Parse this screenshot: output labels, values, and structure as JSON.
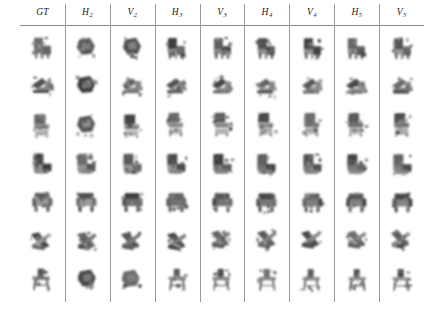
{
  "figure": {
    "kind": "qualitative-comparison-grid",
    "columns": 9,
    "rows": 7,
    "background_color": "#ffffff",
    "rule_color": "#8a8a8a",
    "separator_color": "#9a9a9a",
    "object_category": "chair",
    "render_style": "blurry grayscale voxel reconstruction"
  },
  "header": {
    "labels": [
      {
        "base": "GT",
        "sub": ""
      },
      {
        "base": "H",
        "sub": "2"
      },
      {
        "base": "V",
        "sub": "2"
      },
      {
        "base": "H",
        "sub": "3"
      },
      {
        "base": "V",
        "sub": "3"
      },
      {
        "base": "H",
        "sub": "4"
      },
      {
        "base": "V",
        "sub": "4"
      },
      {
        "base": "H",
        "sub": "5"
      },
      {
        "base": "V",
        "sub": "5"
      }
    ]
  },
  "rows": [
    {
      "name": "row-1",
      "shape": "side-chair",
      "cells": [
        {
          "col": "GT",
          "shape": "side-chair",
          "variant": 0
        },
        {
          "col": "H2",
          "shape": "blob-chair",
          "variant": 1
        },
        {
          "col": "V2",
          "shape": "blob-chair",
          "variant": 2
        },
        {
          "col": "H3",
          "shape": "side-chair",
          "variant": 3
        },
        {
          "col": "V3",
          "shape": "side-chair",
          "variant": 4
        },
        {
          "col": "H4",
          "shape": "side-chair",
          "variant": 5
        },
        {
          "col": "V4",
          "shape": "side-chair",
          "variant": 6
        },
        {
          "col": "H5",
          "shape": "side-chair",
          "variant": 7
        },
        {
          "col": "V5",
          "shape": "side-chair",
          "variant": 8
        }
      ]
    },
    {
      "name": "row-2",
      "shape": "lounger",
      "cells": [
        {
          "col": "GT",
          "shape": "lounger",
          "variant": 0
        },
        {
          "col": "H2",
          "shape": "blob-chair",
          "variant": 1
        },
        {
          "col": "V2",
          "shape": "lounger",
          "variant": 2
        },
        {
          "col": "H3",
          "shape": "lounger",
          "variant": 3
        },
        {
          "col": "V3",
          "shape": "lounger",
          "variant": 4
        },
        {
          "col": "H4",
          "shape": "lounger",
          "variant": 5
        },
        {
          "col": "V4",
          "shape": "lounger",
          "variant": 6
        },
        {
          "col": "H5",
          "shape": "lounger",
          "variant": 7
        },
        {
          "col": "V5",
          "shape": "lounger",
          "variant": 8
        }
      ]
    },
    {
      "name": "row-3",
      "shape": "slat-back-chair",
      "cells": [
        {
          "col": "GT",
          "shape": "slat-back-chair",
          "variant": 0
        },
        {
          "col": "H2",
          "shape": "blob-chair",
          "variant": 1
        },
        {
          "col": "V2",
          "shape": "slat-back-chair",
          "variant": 2
        },
        {
          "col": "H3",
          "shape": "slat-back-chair",
          "variant": 3
        },
        {
          "col": "V3",
          "shape": "slat-back-chair",
          "variant": 4
        },
        {
          "col": "H4",
          "shape": "slat-back-chair",
          "variant": 5
        },
        {
          "col": "V4",
          "shape": "slat-back-chair",
          "variant": 6
        },
        {
          "col": "H5",
          "shape": "slat-back-chair",
          "variant": 7
        },
        {
          "col": "V5",
          "shape": "slat-back-chair",
          "variant": 8
        }
      ]
    },
    {
      "name": "row-4",
      "shape": "block-armchair",
      "cells": [
        {
          "col": "GT",
          "shape": "block-armchair",
          "variant": 0
        },
        {
          "col": "H2",
          "shape": "block-armchair",
          "variant": 1
        },
        {
          "col": "V2",
          "shape": "block-armchair",
          "variant": 2
        },
        {
          "col": "H3",
          "shape": "block-armchair",
          "variant": 3
        },
        {
          "col": "V3",
          "shape": "block-armchair",
          "variant": 4
        },
        {
          "col": "H4",
          "shape": "block-armchair",
          "variant": 5
        },
        {
          "col": "V4",
          "shape": "block-armchair",
          "variant": 6
        },
        {
          "col": "H5",
          "shape": "block-armchair",
          "variant": 7
        },
        {
          "col": "V5",
          "shape": "block-armchair",
          "variant": 8
        }
      ]
    },
    {
      "name": "row-5",
      "shape": "armchair",
      "cells": [
        {
          "col": "GT",
          "shape": "armchair",
          "variant": 0
        },
        {
          "col": "H2",
          "shape": "armchair",
          "variant": 1
        },
        {
          "col": "V2",
          "shape": "armchair",
          "variant": 2
        },
        {
          "col": "H3",
          "shape": "armchair",
          "variant": 3
        },
        {
          "col": "V3",
          "shape": "armchair",
          "variant": 4
        },
        {
          "col": "H4",
          "shape": "armchair",
          "variant": 5
        },
        {
          "col": "V4",
          "shape": "armchair",
          "variant": 6
        },
        {
          "col": "H5",
          "shape": "armchair",
          "variant": 7
        },
        {
          "col": "V5",
          "shape": "armchair",
          "variant": 8
        }
      ]
    },
    {
      "name": "row-6",
      "shape": "folding-chair",
      "cells": [
        {
          "col": "GT",
          "shape": "folding-chair",
          "variant": 0
        },
        {
          "col": "H2",
          "shape": "folding-chair",
          "variant": 1
        },
        {
          "col": "V2",
          "shape": "folding-chair",
          "variant": 2
        },
        {
          "col": "H3",
          "shape": "folding-chair",
          "variant": 3
        },
        {
          "col": "V3",
          "shape": "folding-chair",
          "variant": 4
        },
        {
          "col": "H4",
          "shape": "folding-chair",
          "variant": 5
        },
        {
          "col": "V4",
          "shape": "folding-chair",
          "variant": 6
        },
        {
          "col": "H5",
          "shape": "folding-chair",
          "variant": 7
        },
        {
          "col": "V5",
          "shape": "folding-chair",
          "variant": 8
        }
      ]
    },
    {
      "name": "row-7",
      "shape": "stool",
      "cells": [
        {
          "col": "GT",
          "shape": "stool",
          "variant": 0
        },
        {
          "col": "H2",
          "shape": "blob-chair",
          "variant": 1
        },
        {
          "col": "V2",
          "shape": "blob-chair",
          "variant": 2
        },
        {
          "col": "H3",
          "shape": "stool",
          "variant": 3
        },
        {
          "col": "V3",
          "shape": "stool",
          "variant": 4
        },
        {
          "col": "H4",
          "shape": "stool",
          "variant": 5
        },
        {
          "col": "V4",
          "shape": "stool",
          "variant": 6
        },
        {
          "col": "H5",
          "shape": "stool",
          "variant": 7
        },
        {
          "col": "V5",
          "shape": "stool",
          "variant": 8
        }
      ]
    }
  ]
}
